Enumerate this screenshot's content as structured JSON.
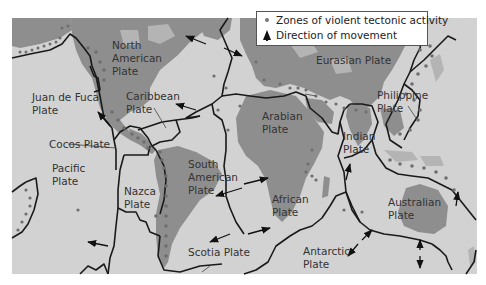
{
  "map": {
    "title": "Tectonic plates world map",
    "colors": {
      "background": "#ffffff",
      "ocean": "#d2d2d2",
      "land": "#8e8e8e",
      "boundary": "#1a1a1a",
      "activity_dot": "#6e6e6e"
    },
    "legend": {
      "items": [
        {
          "icon": "dot-icon",
          "label": "Zones of violent tectonic activity"
        },
        {
          "icon": "arrow-up-icon",
          "label": "Direction of movement"
        }
      ]
    },
    "plates": {
      "north_american": {
        "line1": "North",
        "line2": "American",
        "line3": "Plate"
      },
      "eurasian": {
        "line1": "Eurasian Plate"
      },
      "juan_de_fuca": {
        "line1": "Juan de Fuca",
        "line2": "Plate"
      },
      "caribbean": {
        "line1": "Caribbean",
        "line2": "Plate"
      },
      "arabian": {
        "line1": "Arabian",
        "line2": "Plate"
      },
      "philippine": {
        "line1": "Philippine",
        "line2": "Plate"
      },
      "cocos": {
        "line1": "Cocos Plate"
      },
      "indian": {
        "line1": "Indian",
        "line2": "Plate"
      },
      "pacific": {
        "line1": "Pacific",
        "line2": "Plate"
      },
      "south_american": {
        "line1": "South",
        "line2": "American",
        "line3": "Plate"
      },
      "nazca": {
        "line1": "Nazca",
        "line2": "Plate"
      },
      "african": {
        "line1": "African",
        "line2": "Plate"
      },
      "australian": {
        "line1": "Australian",
        "line2": "Plate"
      },
      "scotia": {
        "line1": "Scotia Plate"
      },
      "antarctic": {
        "line1": "Antarctic",
        "line2": "Plate"
      }
    }
  }
}
